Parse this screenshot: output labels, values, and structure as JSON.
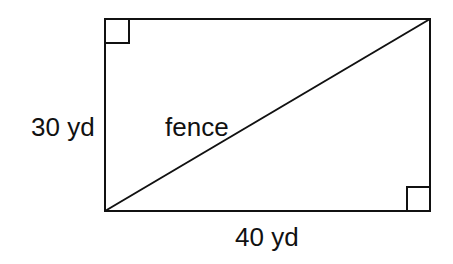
{
  "diagram": {
    "type": "rectangle-with-diagonal",
    "labels": {
      "left_side": "30 yd",
      "bottom_side": "40 yd",
      "diagonal": "fence"
    },
    "colors": {
      "stroke": "#111111",
      "background": "#ffffff"
    },
    "right_angle_markers": [
      "top-left",
      "bottom-right"
    ]
  }
}
